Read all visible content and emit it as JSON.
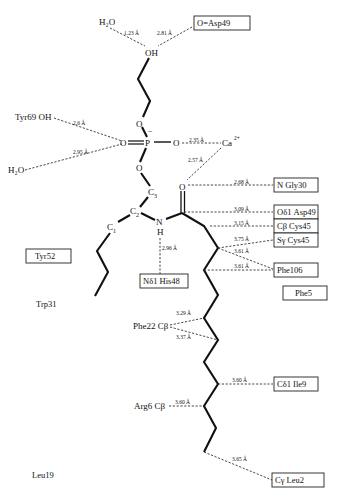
{
  "diagram": {
    "type": "ligand-interaction-diagram",
    "atoms": {
      "water_top": "H₂O",
      "hydroxyl": "OH",
      "phosphorus": "P",
      "phosphate_charge": "−",
      "o_double": "O",
      "o_right": "O",
      "o_upper": "O",
      "o_lower": "O",
      "c3": "C",
      "c3_sub": "3",
      "c2": "C",
      "c2_sub": "2",
      "c1": "C",
      "c1_sub": "1",
      "nitrogen": "N",
      "hydrogen": "H",
      "carbonyl_o": "O",
      "calcium": "Ca",
      "calcium_charge": "2+",
      "tyr69": "Tyr69 OH",
      "water_left": "H₂O",
      "phe22": "Phe22 Cβ",
      "arg6": "Arg6 Cβ"
    },
    "boxed_residues": {
      "asp49_o": "O=Asp49",
      "gly30": "N  Gly30",
      "asp49_od1": "Oδ1  Asp49",
      "cys45_cb": "Cβ  Cys45",
      "cys45_sg": "Sγ  Cys45",
      "phe106": "Phe106",
      "phe5": "Phe5",
      "his48": "Nδ1  His48",
      "tyr52": "Tyr52",
      "ile9": "Cδ1  Ile9",
      "leu2": "Cγ Leu2"
    },
    "free_residues": {
      "trp31": "Trp31",
      "leu19": "Leu19"
    },
    "distances": {
      "water_oh": "1.23 Å",
      "asp49_oh": "2.81 Å",
      "tyr69": "2.6 Å",
      "water_left": "2.95 Å",
      "ca_o": "2.35 Å",
      "ca_carbonyl": "2.57 Å",
      "gly30": "2.68 Å",
      "asp49_od1": "3.09 Å",
      "cys45_cb": "3.15 Å",
      "cys45_sg": "3.75 Å",
      "phe106_a": "3.61 Å",
      "phe106_b": "3.61 Å",
      "his48": "2.96 Å",
      "phe22_a": "3.29 Å",
      "phe22_b": "3.37 Å",
      "ile9": "3.60 Å",
      "arg6": "3.60 Å",
      "leu2": "3.65 Å"
    }
  }
}
